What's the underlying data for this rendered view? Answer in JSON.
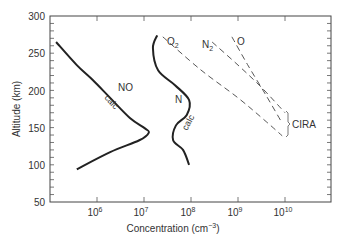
{
  "chart_data": {
    "type": "line",
    "title": "",
    "xlabel": "Concentration (cm⁻³)",
    "ylabel": "Altitude (km)",
    "xscale": "log",
    "xlim_log10": [
      5.0,
      10.95
    ],
    "ylim": [
      50,
      300
    ],
    "x_ticks": [
      {
        "label_base": "10",
        "label_exp": "6",
        "log10": 6
      },
      {
        "label_base": "10",
        "label_exp": "7",
        "log10": 7
      },
      {
        "label_base": "10",
        "label_exp": "8",
        "log10": 8
      },
      {
        "label_base": "10",
        "label_exp": "9",
        "log10": 9
      },
      {
        "label_base": "10",
        "label_exp": "10",
        "log10": 10
      }
    ],
    "y_ticks": [
      50,
      100,
      150,
      200,
      250,
      300
    ],
    "grid": false,
    "series": [
      {
        "name": "NO",
        "sublabel": "calc",
        "style": "solid",
        "points_log10_alt": [
          [
            5.13,
            265
          ],
          [
            5.57,
            234
          ],
          [
            5.91,
            214
          ],
          [
            6.28,
            190
          ],
          [
            6.7,
            163
          ],
          [
            7.02,
            149
          ],
          [
            7.1,
            143
          ],
          [
            6.9,
            133
          ],
          [
            6.28,
            117
          ],
          [
            5.57,
            94
          ]
        ]
      },
      {
        "name": "N",
        "sublabel": "calc",
        "style": "solid",
        "points_log10_alt": [
          [
            7.28,
            274
          ],
          [
            7.19,
            257
          ],
          [
            7.3,
            227
          ],
          [
            7.66,
            207
          ],
          [
            7.96,
            187
          ],
          [
            7.91,
            167
          ],
          [
            7.68,
            153
          ],
          [
            7.62,
            133
          ],
          [
            7.83,
            120
          ],
          [
            7.96,
            100
          ]
        ]
      },
      {
        "name": "O₂",
        "style": "dashed",
        "points_log10_alt": [
          [
            7.4,
            272
          ],
          [
            8.2,
            228
          ],
          [
            9.0,
            190
          ],
          [
            9.6,
            158
          ],
          [
            9.94,
            139
          ]
        ]
      },
      {
        "name": "N₂",
        "style": "dashed",
        "points_log10_alt": [
          [
            8.45,
            265
          ],
          [
            9.0,
            234
          ],
          [
            9.5,
            204
          ],
          [
            10.0,
            170
          ]
        ]
      },
      {
        "name": "O",
        "style": "dashed",
        "points_log10_alt": [
          [
            8.87,
            272
          ],
          [
            9.2,
            235
          ],
          [
            9.6,
            193
          ],
          [
            9.94,
            156
          ]
        ]
      }
    ],
    "annotations": [
      {
        "text": "CIRA",
        "note": "bracket grouping dashed O₂, N₂, O curves",
        "alt_range": [
          139,
          172
        ]
      },
      {
        "text": "NO"
      },
      {
        "text": "calc"
      },
      {
        "text": "N"
      },
      {
        "text": "calc"
      },
      {
        "text": "O₂"
      },
      {
        "text": "N₂"
      },
      {
        "text": "O"
      }
    ]
  },
  "labels": {
    "xlabel_main": "Concentration (cm",
    "xlabel_exp": "−3",
    "xlabel_close": ")",
    "ylabel": "Altitude (km)",
    "no": "NO",
    "no_calc": "calc",
    "n": "N",
    "n_calc": "calc",
    "o2_base": "O",
    "o2_sub": "2",
    "n2_base": "N",
    "n2_sub": "2",
    "o": "O",
    "cira": "CIRA",
    "y50": "50",
    "y100": "100",
    "y150": "150",
    "y200": "200",
    "y250": "250",
    "y300": "300",
    "x6b": "10",
    "x6e": "6",
    "x7b": "10",
    "x7e": "7",
    "x8b": "10",
    "x8e": "8",
    "x9b": "10",
    "x9e": "9",
    "x10b": "10",
    "x10e": "10"
  }
}
